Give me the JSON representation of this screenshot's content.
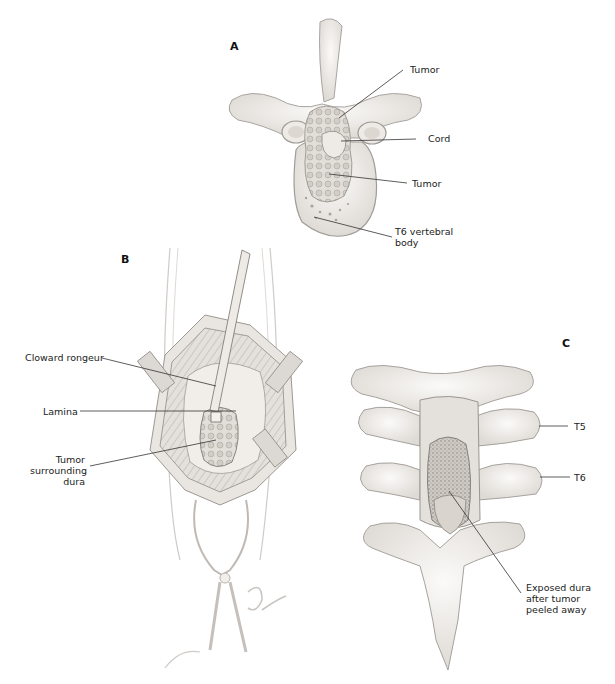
{
  "figure": {
    "panels": [
      {
        "id": "A",
        "letter": "A",
        "labels": [
          {
            "text": "Tumor"
          },
          {
            "text": "Cord"
          },
          {
            "text": "Tumor"
          },
          {
            "line1": "T6 vertebral",
            "line2": "body"
          }
        ]
      },
      {
        "id": "B",
        "letter": "B",
        "labels": [
          {
            "text": "Cloward rongeur"
          },
          {
            "text": "Lamina"
          },
          {
            "line1": "Tumor",
            "line2": "surrounding",
            "line3": "dura"
          }
        ]
      },
      {
        "id": "C",
        "letter": "C",
        "labels": [
          {
            "text": "T5"
          },
          {
            "text": "T6"
          },
          {
            "line1": "Exposed dura",
            "line2": "after tumor",
            "line3": "peeled away"
          }
        ]
      }
    ]
  },
  "colors": {
    "background": "#ffffff",
    "ink": "#222222",
    "bone_fill": "#f1efec",
    "bone_stroke": "#9a9794",
    "tissue_shade": "#c9c5c0",
    "dura_fill": "#b9b4ae"
  }
}
